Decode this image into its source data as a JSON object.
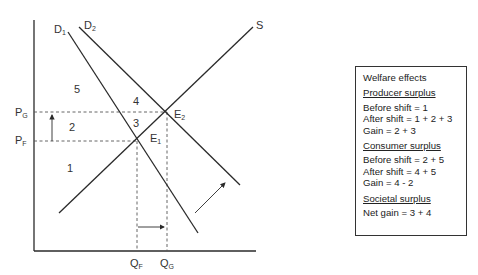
{
  "diagram": {
    "curves": {
      "supply": "S",
      "demand1": {
        "main": "D",
        "sub": "1"
      },
      "demand2": {
        "main": "D",
        "sub": "2"
      }
    },
    "points": {
      "e1": {
        "main": "E",
        "sub": "1"
      },
      "e2": {
        "main": "E",
        "sub": "2"
      }
    },
    "prices": {
      "pg": {
        "main": "P",
        "sub": "G"
      },
      "pf": {
        "main": "P",
        "sub": "F"
      }
    },
    "quantities": {
      "qf": {
        "main": "Q",
        "sub": "F"
      },
      "qg": {
        "main": "Q",
        "sub": "G"
      }
    },
    "areas": [
      "1",
      "2",
      "3",
      "4",
      "5"
    ]
  },
  "welfare_box": {
    "title": "Welfare effects",
    "producer": {
      "heading": "Producer surplus",
      "lines": [
        "Before shift = 1",
        "After shift = 1 + 2 + 3",
        "Gain = 2 + 3"
      ]
    },
    "consumer": {
      "heading": "Consumer surplus",
      "lines": [
        "Before shift = 2 + 5",
        "After shift = 4 + 5",
        "Gain = 4 - 2"
      ]
    },
    "societal": {
      "heading": "Societal surplus",
      "lines": [
        "Net gain = 3 + 4"
      ]
    }
  },
  "colors": {
    "line": "#2a2a2a",
    "dashed": "#555555"
  }
}
